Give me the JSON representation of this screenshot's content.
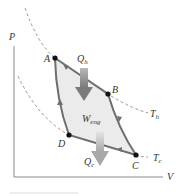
{
  "figure": {
    "type": "PV diagram - Carnot cycle",
    "axes": {
      "y_label": "P",
      "x_label": "V"
    },
    "points": [
      {
        "label": "A",
        "x": 55,
        "y": 58
      },
      {
        "label": "B",
        "x": 108,
        "y": 94
      },
      {
        "label": "C",
        "x": 136,
        "y": 155
      },
      {
        "label": "D",
        "x": 69,
        "y": 135
      }
    ],
    "isotherms": [
      {
        "label": "T",
        "sub": "h",
        "name": "hot"
      },
      {
        "label": "T",
        "sub": "c",
        "name": "cold"
      }
    ],
    "heat_in": {
      "label": "Q",
      "sub": "h"
    },
    "heat_out": {
      "label": "Q",
      "sub": "c"
    },
    "work": {
      "label": "W",
      "sub": "eng"
    },
    "colors": {
      "cycle_line": "#6e6e6e",
      "cycle_fill": "#ebebeb",
      "arrow": "#8a8a8a",
      "isotherm": "#8c8c8c",
      "axis": "#888888",
      "point": "#111111"
    }
  }
}
